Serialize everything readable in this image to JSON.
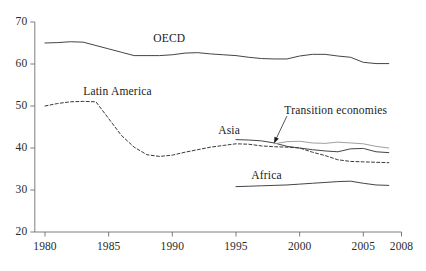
{
  "chart_data": {
    "type": "line",
    "title": "",
    "subtitle": "",
    "xlabel": "",
    "ylabel": "",
    "xlim": [
      1979.2,
      2008
    ],
    "ylim": [
      20,
      70
    ],
    "grid": false,
    "legend_position": "inline-labels",
    "x_ticks": [
      "1980",
      "1985",
      "1990",
      "1995",
      "2000",
      "2005",
      "2008"
    ],
    "x_tick_values": [
      1980,
      1985,
      1990,
      1995,
      2000,
      2005,
      2008
    ],
    "y_ticks": [
      "20",
      "30",
      "40",
      "50",
      "60",
      "70"
    ],
    "y_tick_values": [
      20,
      30,
      40,
      50,
      60,
      70
    ],
    "series": [
      {
        "name": "OECD",
        "style": "solid",
        "color": "#3a3a3a",
        "label_x": 1988.5,
        "label_y": 65.6,
        "x": [
          1980,
          1981,
          1982,
          1983,
          1984,
          1985,
          1986,
          1987,
          1988,
          1989,
          1990,
          1991,
          1992,
          1993,
          1994,
          1995,
          1996,
          1997,
          1998,
          1999,
          2000,
          2001,
          2002,
          2003,
          2004,
          2005,
          2006,
          2007
        ],
        "values": [
          65.0,
          65.1,
          65.3,
          65.2,
          64.4,
          63.6,
          62.8,
          62.0,
          62.0,
          62.0,
          62.2,
          62.6,
          62.7,
          62.4,
          62.2,
          62.0,
          61.6,
          61.3,
          61.2,
          61.2,
          61.9,
          62.3,
          62.3,
          61.9,
          61.6,
          60.4,
          60.1,
          60.1
        ]
      },
      {
        "name": "Latin America",
        "style": "dashed",
        "color": "#3a3a3a",
        "label_x": 1983.0,
        "label_y": 53.2,
        "x": [
          1980,
          1981,
          1982,
          1983,
          1984,
          1985,
          1986,
          1987,
          1988,
          1989,
          1990,
          1991,
          1992,
          1993,
          1994,
          1995,
          1996,
          1997,
          1998,
          1999,
          2000,
          2001,
          2002,
          2003,
          2004,
          2005,
          2006,
          2007
        ],
        "values": [
          50.0,
          50.6,
          51.0,
          51.1,
          51.0,
          47.0,
          43.0,
          40.2,
          38.4,
          38.0,
          38.3,
          39.0,
          39.6,
          40.2,
          40.6,
          41.0,
          40.9,
          40.5,
          40.3,
          40.2,
          40.0,
          39.0,
          38.2,
          37.2,
          36.8,
          36.7,
          36.6,
          36.5
        ]
      },
      {
        "name": "Asia",
        "style": "solid",
        "color": "#3a3a3a",
        "label_x": 1993.6,
        "label_y": 43.8,
        "x": [
          1995,
          1996,
          1997,
          1998,
          1999,
          2000,
          2001,
          2002,
          2003,
          2004,
          2005,
          2006,
          2007
        ],
        "values": [
          42.0,
          41.9,
          41.7,
          41.2,
          40.4,
          40.0,
          39.6,
          39.3,
          39.1,
          39.8,
          39.9,
          39.1,
          38.9
        ]
      },
      {
        "name": "Transition economies",
        "style": "solid",
        "color": "#9a9a9a",
        "label_x": 1998.8,
        "label_y": 48.6,
        "x": [
          1998,
          1999,
          2000,
          2001,
          2002,
          2003,
          2004,
          2005,
          2006,
          2007
        ],
        "values": [
          41.0,
          41.5,
          41.6,
          41.2,
          41.1,
          41.4,
          41.2,
          41.0,
          40.4,
          40.0
        ]
      },
      {
        "name": "Africa",
        "style": "solid",
        "color": "#3a3a3a",
        "label_x": 1996.2,
        "label_y": 33.0,
        "x": [
          1995,
          1996,
          1997,
          1998,
          1999,
          2000,
          2001,
          2002,
          2003,
          2004,
          2005,
          2006,
          2007
        ],
        "values": [
          30.8,
          30.9,
          31.0,
          31.1,
          31.2,
          31.4,
          31.6,
          31.8,
          32.0,
          32.1,
          31.6,
          31.2,
          31.1
        ]
      }
    ],
    "annotations": [
      {
        "text": "Transition economies",
        "arrow_from_x": 1999.0,
        "arrow_from_y": 47.6,
        "arrow_to_x": 1998.0,
        "arrow_to_y": 41.2
      }
    ]
  },
  "axes": {
    "y_tick_labels": [
      "70",
      "60",
      "50",
      "40",
      "30",
      "20"
    ],
    "x_tick_labels": [
      "1980",
      "1985",
      "1990",
      "1995",
      "2000",
      "2005",
      "2008"
    ],
    "axis_color": "#6e6e6e"
  },
  "labels": {
    "oecd": "OECD",
    "latin_america": "Latin America",
    "asia": "Asia",
    "transition_economies": "Transition economies",
    "africa": "Africa"
  }
}
